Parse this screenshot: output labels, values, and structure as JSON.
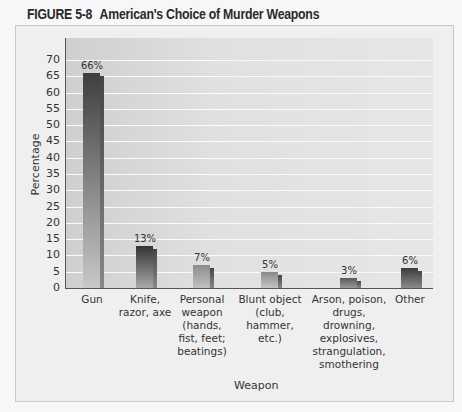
{
  "figure": {
    "number": "FIGURE 5-8",
    "title": "American's Choice of Murder Weapons"
  },
  "chart_data": {
    "type": "bar",
    "title": "American's Choice of Murder Weapons",
    "xlabel": "Weapon",
    "ylabel": "Percentage",
    "ylim": [
      0,
      70
    ],
    "yticks": [
      0,
      5,
      10,
      15,
      20,
      25,
      30,
      35,
      40,
      45,
      50,
      55,
      60,
      65,
      70
    ],
    "grid": true,
    "categories": [
      "Gun",
      "Knife, razor, axe",
      "Personal weapon (hands, fist, feet; beatings)",
      "Blunt object (club, hammer, etc.)",
      "Arson, poison, drugs, drowning, explosives, strangulation, smothering",
      "Other"
    ],
    "values": [
      66,
      13,
      7,
      5,
      3,
      6
    ],
    "data_labels": [
      "66%",
      "13%",
      "7%",
      "5%",
      "3%",
      "6%"
    ]
  },
  "axis": {
    "y_ticks": [
      "0",
      "5",
      "10",
      "15",
      "20",
      "25",
      "30",
      "35",
      "40",
      "45",
      "50",
      "55",
      "60",
      "65",
      "70"
    ],
    "y_label": "Percentage",
    "x_label": "Weapon",
    "x_ticks": [
      "Gun",
      "Knife,\nrazor, axe",
      "Personal\nweapon\n(hands,\nfist, feet;\nbeatings)",
      "Blunt object\n(club,\nhammer,\netc.)",
      "Arson, poison,\ndrugs,\ndrowning,\nexplosives,\nstrangulation,\nsmothering",
      "Other"
    ]
  },
  "colors": {
    "bar_dark": "#3a3a3a",
    "bar_mid": "#6e6e6e",
    "bar_light": "#9a9a9a",
    "plot_bg": "#d8d8d8",
    "gridline": "#fafafa"
  }
}
